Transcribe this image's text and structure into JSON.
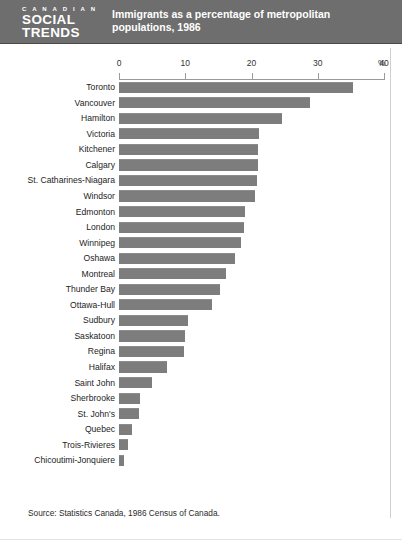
{
  "header": {
    "masthead_line1": "C A N A D I A N",
    "masthead_line2": "SOCIAL",
    "masthead_line3": "TRENDS",
    "title": "Immigrants as a percentage of metropolitan populations, 1986",
    "background_color": "#6e6e6e",
    "text_color": "#ffffff"
  },
  "source": "Source: Statistics Canada, 1986 Census of Canada.",
  "axis": {
    "unit": "%",
    "ticks": [
      "0",
      "10",
      "20",
      "30",
      "40"
    ]
  },
  "chart_data": {
    "type": "bar",
    "orientation": "horizontal",
    "title": "Immigrants as a percentage of metropolitan populations, 1986",
    "xlabel": "%",
    "ylabel": "",
    "xlim": [
      0,
      40
    ],
    "xticks": [
      0,
      10,
      20,
      30,
      40
    ],
    "grid": false,
    "legend": false,
    "bar_color": "#7d7d7d",
    "categories": [
      "Toronto",
      "Vancouver",
      "Hamilton",
      "Victoria",
      "Kitchener",
      "Calgary",
      "St. Catharines-Niagara",
      "Windsor",
      "Edmonton",
      "London",
      "Winnipeg",
      "Oshawa",
      "Montreal",
      "Thunder Bay",
      "Ottawa-Hull",
      "Sudbury",
      "Saskatoon",
      "Regina",
      "Halifax",
      "Saint John",
      "Sherbrooke",
      "St. John's",
      "Quebec",
      "Trois-Rivieres",
      "Chicoutimi-Jonquiere"
    ],
    "values": [
      35.3,
      28.9,
      24.6,
      21.2,
      21.0,
      21.0,
      20.9,
      20.5,
      19.0,
      18.8,
      18.4,
      17.5,
      16.2,
      15.3,
      14.1,
      10.4,
      10.0,
      9.8,
      7.3,
      5.0,
      3.2,
      3.0,
      2.0,
      1.3,
      0.7
    ]
  }
}
